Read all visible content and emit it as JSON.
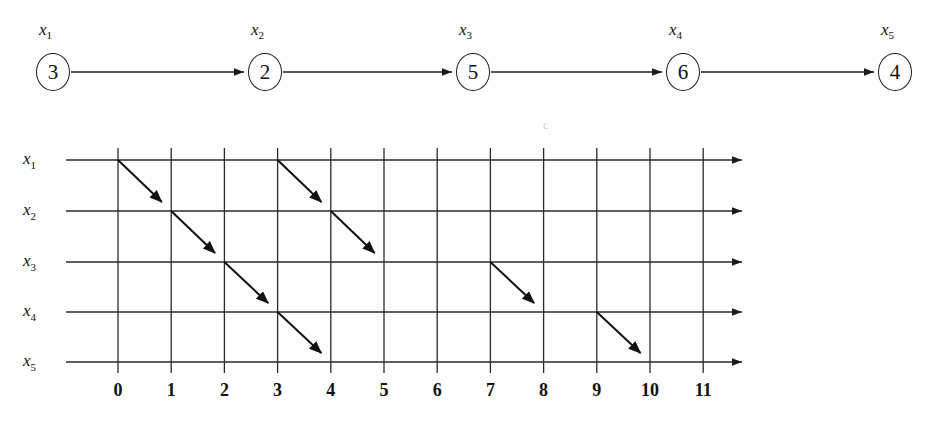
{
  "chain": {
    "nodes": [
      {
        "label": "x",
        "sub": "1",
        "value": "3",
        "cx": 53,
        "cy": 72
      },
      {
        "label": "x",
        "sub": "2",
        "value": "2",
        "cx": 265,
        "cy": 72
      },
      {
        "label": "x",
        "sub": "3",
        "value": "5",
        "cx": 473,
        "cy": 72
      },
      {
        "label": "x",
        "sub": "4",
        "value": "6",
        "cx": 683,
        "cy": 72
      },
      {
        "label": "x",
        "sub": "5",
        "value": "4",
        "cx": 895,
        "cy": 72
      }
    ],
    "label_y": 20,
    "edges": [
      {
        "from": 0,
        "to": 1
      },
      {
        "from": 1,
        "to": 2
      },
      {
        "from": 2,
        "to": 3
      },
      {
        "from": 3,
        "to": 4
      }
    ]
  },
  "grid": {
    "row_labels": [
      {
        "label": "x",
        "sub": "1",
        "y": 42
      },
      {
        "label": "x",
        "sub": "2",
        "y": 93
      },
      {
        "label": "x",
        "sub": "3",
        "y": 144
      },
      {
        "label": "x",
        "sub": "4",
        "y": 194
      },
      {
        "label": "x",
        "sub": "5",
        "y": 244
      }
    ],
    "row_label_x": 36,
    "tick_labels": [
      "0",
      "1",
      "2",
      "3",
      "4",
      "5",
      "6",
      "7",
      "8",
      "9",
      "10",
      "11"
    ],
    "tick_label_y": 262,
    "x_origin": 118,
    "x_step": 53.2,
    "line_left": 66,
    "line_right": 742,
    "v_top": 30,
    "v_bottom": 255,
    "artifact": {
      "text": "c",
      "x": 543,
      "y": 0
    }
  },
  "chart_data": {
    "type": "line",
    "title": "",
    "xlabel": "",
    "ylabel": "",
    "xlim": [
      0,
      11
    ],
    "grid": true,
    "categories": [
      "x1",
      "x2",
      "x3",
      "x4",
      "x5"
    ],
    "x_ticks": [
      0,
      1,
      2,
      3,
      4,
      5,
      6,
      7,
      8,
      9,
      10,
      11
    ],
    "node_values": [
      3,
      2,
      5,
      6,
      4
    ],
    "node_labels": [
      "x1",
      "x2",
      "x3",
      "x4",
      "x5"
    ],
    "arrows": [
      {
        "x0": 0,
        "row0": 1,
        "x1": 1,
        "row1": 2
      },
      {
        "x0": 1,
        "row0": 2,
        "x1": 2,
        "row1": 3
      },
      {
        "x0": 2,
        "row0": 3,
        "x1": 3,
        "row1": 4
      },
      {
        "x0": 3,
        "row0": 4,
        "x1": 4,
        "row1": 5
      },
      {
        "x0": 3,
        "row0": 1,
        "x1": 4,
        "row1": 2
      },
      {
        "x0": 4,
        "row0": 2,
        "x1": 5,
        "row1": 3
      },
      {
        "x0": 7,
        "row0": 3,
        "x1": 8,
        "row1": 4
      },
      {
        "x0": 9,
        "row0": 4,
        "x1": 10,
        "row1": 5
      }
    ]
  }
}
